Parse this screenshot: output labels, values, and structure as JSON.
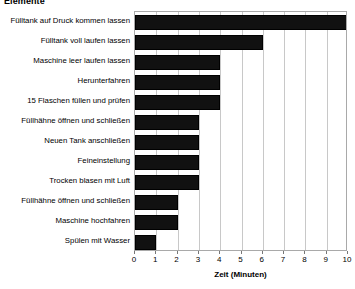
{
  "chart_data": {
    "type": "bar",
    "orientation": "horizontal",
    "title": "Elemente",
    "xlabel": "Zeit (Minuten)",
    "ylabel": "",
    "xlim": [
      0,
      10
    ],
    "xticks": [
      0,
      1,
      2,
      3,
      4,
      5,
      6,
      7,
      8,
      9,
      10
    ],
    "grid": true,
    "legend": false,
    "bar_color": "#111111",
    "categories": [
      "Fülltank auf Druck kommen lassen",
      "Fülltank voll laufen lassen",
      "Maschine leer laufen lassen",
      "Herunterfahren",
      "15 Flaschen füllen und prüfen",
      "Füllhähne öffnen und schließen",
      "Neuen Tank anschließen",
      "Feineinstellung",
      "Trocken blasen mit Luft",
      "Füllhähne öffnen und schließen",
      "Maschine hochfahren",
      "Spülen mit Wasser"
    ],
    "values": [
      10,
      6,
      4,
      4,
      4,
      3,
      3,
      3,
      3,
      2,
      2,
      1
    ]
  }
}
